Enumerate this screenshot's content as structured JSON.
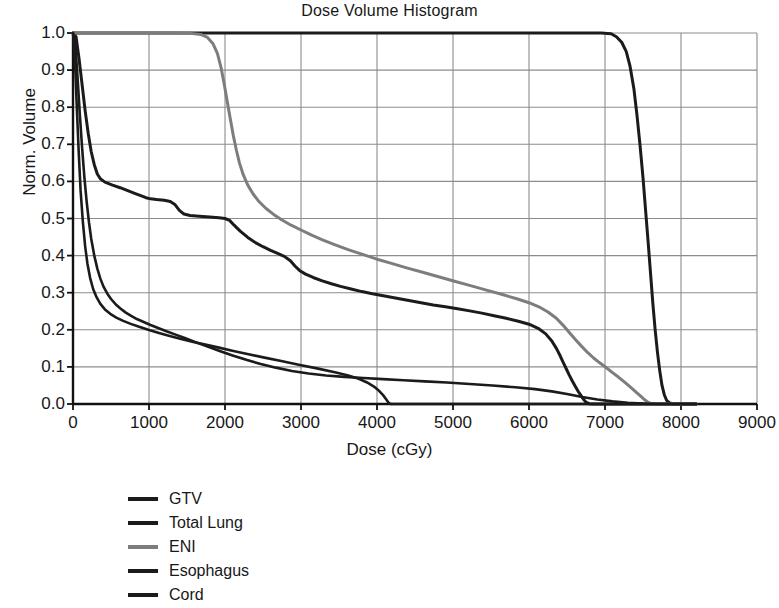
{
  "chart_data": {
    "type": "line",
    "title": "Dose Volume Histogram",
    "xlabel": "Dose (cGy)",
    "ylabel": "Norm. Volume",
    "xlim": [
      0,
      9000
    ],
    "ylim": [
      0,
      1.0
    ],
    "xticks": [
      0,
      1000,
      2000,
      3000,
      4000,
      5000,
      6000,
      7000,
      8000,
      9000
    ],
    "xtick_labels": [
      "0",
      "1000",
      "2000",
      "3000",
      "4000",
      "5000",
      "6000",
      "7000",
      "8000",
      "9000"
    ],
    "yticks": [
      0.0,
      0.1,
      0.2,
      0.3,
      0.4,
      0.5,
      0.6,
      0.7,
      0.8,
      0.9,
      1.0
    ],
    "ytick_labels": [
      "0.0",
      "0.1",
      "0.2",
      "0.3",
      "0.4",
      "0.5",
      "0.6",
      "0.7",
      "0.8",
      "0.9",
      "1.0"
    ],
    "grid": true,
    "legend_position": "below-left",
    "series": [
      {
        "name": "GTV",
        "color": "#1b1b1b",
        "width": 3.0,
        "points": [
          [
            0,
            1.0
          ],
          [
            500,
            1.0
          ],
          [
            1500,
            1.0
          ],
          [
            2500,
            1.0
          ],
          [
            3500,
            1.0
          ],
          [
            4500,
            1.0
          ],
          [
            5500,
            1.0
          ],
          [
            6200,
            1.0
          ],
          [
            6700,
            1.0
          ],
          [
            6950,
            1.0
          ],
          [
            7080,
            0.998
          ],
          [
            7150,
            0.99
          ],
          [
            7220,
            0.975
          ],
          [
            7280,
            0.95
          ],
          [
            7330,
            0.91
          ],
          [
            7380,
            0.85
          ],
          [
            7420,
            0.78
          ],
          [
            7460,
            0.7
          ],
          [
            7500,
            0.61
          ],
          [
            7535,
            0.52
          ],
          [
            7570,
            0.43
          ],
          [
            7600,
            0.35
          ],
          [
            7630,
            0.27
          ],
          [
            7660,
            0.2
          ],
          [
            7690,
            0.14
          ],
          [
            7720,
            0.09
          ],
          [
            7750,
            0.05
          ],
          [
            7780,
            0.025
          ],
          [
            7810,
            0.01
          ],
          [
            7850,
            0.003
          ],
          [
            7900,
            0.0
          ],
          [
            8200,
            0.0
          ]
        ]
      },
      {
        "name": "Total Lung",
        "color": "#1b1b1b",
        "width": 3.0,
        "points": [
          [
            0,
            1.0
          ],
          [
            40,
            0.99
          ],
          [
            80,
            0.93
          ],
          [
            120,
            0.86
          ],
          [
            160,
            0.79
          ],
          [
            200,
            0.73
          ],
          [
            240,
            0.68
          ],
          [
            280,
            0.645
          ],
          [
            320,
            0.62
          ],
          [
            360,
            0.607
          ],
          [
            420,
            0.598
          ],
          [
            520,
            0.59
          ],
          [
            620,
            0.583
          ],
          [
            720,
            0.575
          ],
          [
            820,
            0.567
          ],
          [
            900,
            0.561
          ],
          [
            960,
            0.556
          ],
          [
            1020,
            0.553
          ],
          [
            1100,
            0.551
          ],
          [
            1200,
            0.549
          ],
          [
            1280,
            0.546
          ],
          [
            1340,
            0.538
          ],
          [
            1400,
            0.522
          ],
          [
            1460,
            0.512
          ],
          [
            1540,
            0.508
          ],
          [
            1660,
            0.506
          ],
          [
            1800,
            0.504
          ],
          [
            1920,
            0.502
          ],
          [
            2000,
            0.5
          ],
          [
            2060,
            0.495
          ],
          [
            2120,
            0.482
          ],
          [
            2200,
            0.466
          ],
          [
            2300,
            0.449
          ],
          [
            2400,
            0.435
          ],
          [
            2500,
            0.424
          ],
          [
            2600,
            0.414
          ],
          [
            2700,
            0.405
          ],
          [
            2780,
            0.398
          ],
          [
            2860,
            0.386
          ],
          [
            2920,
            0.372
          ],
          [
            2980,
            0.36
          ],
          [
            3060,
            0.35
          ],
          [
            3160,
            0.341
          ],
          [
            3280,
            0.332
          ],
          [
            3400,
            0.324
          ],
          [
            3520,
            0.317
          ],
          [
            3660,
            0.31
          ],
          [
            3800,
            0.303
          ],
          [
            3940,
            0.297
          ],
          [
            4100,
            0.291
          ],
          [
            4260,
            0.285
          ],
          [
            4420,
            0.279
          ],
          [
            4580,
            0.273
          ],
          [
            4740,
            0.267
          ],
          [
            4900,
            0.262
          ],
          [
            5060,
            0.257
          ],
          [
            5220,
            0.251
          ],
          [
            5380,
            0.245
          ],
          [
            5540,
            0.238
          ],
          [
            5700,
            0.231
          ],
          [
            5860,
            0.223
          ],
          [
            6000,
            0.215
          ],
          [
            6120,
            0.204
          ],
          [
            6220,
            0.189
          ],
          [
            6300,
            0.17
          ],
          [
            6360,
            0.15
          ],
          [
            6410,
            0.13
          ],
          [
            6450,
            0.112
          ],
          [
            6490,
            0.095
          ],
          [
            6530,
            0.078
          ],
          [
            6570,
            0.062
          ],
          [
            6610,
            0.047
          ],
          [
            6650,
            0.033
          ],
          [
            6690,
            0.021
          ],
          [
            6720,
            0.012
          ],
          [
            6750,
            0.005
          ],
          [
            6790,
            0.001
          ],
          [
            6850,
            0.0
          ],
          [
            8200,
            0.0
          ]
        ]
      },
      {
        "name": "ENI",
        "color": "#7d7d7d",
        "width": 3.0,
        "points": [
          [
            0,
            1.0
          ],
          [
            400,
            1.0
          ],
          [
            900,
            1.0
          ],
          [
            1300,
            1.0
          ],
          [
            1550,
            0.999
          ],
          [
            1680,
            0.996
          ],
          [
            1770,
            0.988
          ],
          [
            1840,
            0.972
          ],
          [
            1900,
            0.945
          ],
          [
            1950,
            0.905
          ],
          [
            1990,
            0.862
          ],
          [
            2030,
            0.815
          ],
          [
            2070,
            0.768
          ],
          [
            2110,
            0.723
          ],
          [
            2150,
            0.684
          ],
          [
            2190,
            0.65
          ],
          [
            2240,
            0.618
          ],
          [
            2300,
            0.59
          ],
          [
            2370,
            0.566
          ],
          [
            2450,
            0.545
          ],
          [
            2540,
            0.527
          ],
          [
            2640,
            0.511
          ],
          [
            2750,
            0.496
          ],
          [
            2870,
            0.482
          ],
          [
            3000,
            0.469
          ],
          [
            3140,
            0.455
          ],
          [
            3290,
            0.442
          ],
          [
            3450,
            0.429
          ],
          [
            3620,
            0.416
          ],
          [
            3800,
            0.404
          ],
          [
            3990,
            0.391
          ],
          [
            4190,
            0.379
          ],
          [
            4390,
            0.367
          ],
          [
            4600,
            0.355
          ],
          [
            4810,
            0.343
          ],
          [
            5020,
            0.331
          ],
          [
            5230,
            0.319
          ],
          [
            5440,
            0.307
          ],
          [
            5650,
            0.295
          ],
          [
            5850,
            0.283
          ],
          [
            6000,
            0.273
          ],
          [
            6130,
            0.262
          ],
          [
            6250,
            0.248
          ],
          [
            6360,
            0.231
          ],
          [
            6450,
            0.212
          ],
          [
            6530,
            0.193
          ],
          [
            6610,
            0.174
          ],
          [
            6690,
            0.156
          ],
          [
            6770,
            0.139
          ],
          [
            6850,
            0.124
          ],
          [
            6930,
            0.111
          ],
          [
            7010,
            0.099
          ],
          [
            7090,
            0.086
          ],
          [
            7180,
            0.072
          ],
          [
            7270,
            0.057
          ],
          [
            7350,
            0.043
          ],
          [
            7420,
            0.03
          ],
          [
            7480,
            0.019
          ],
          [
            7530,
            0.01
          ],
          [
            7570,
            0.004
          ],
          [
            7620,
            0.0
          ],
          [
            8200,
            0.0
          ]
        ]
      },
      {
        "name": "Esophagus",
        "color": "#1b1b1b",
        "width": 2.6,
        "points": [
          [
            0,
            1.0
          ],
          [
            30,
            0.97
          ],
          [
            60,
            0.88
          ],
          [
            90,
            0.78
          ],
          [
            120,
            0.69
          ],
          [
            150,
            0.61
          ],
          [
            180,
            0.545
          ],
          [
            210,
            0.49
          ],
          [
            240,
            0.445
          ],
          [
            280,
            0.4
          ],
          [
            320,
            0.365
          ],
          [
            360,
            0.338
          ],
          [
            400,
            0.317
          ],
          [
            450,
            0.298
          ],
          [
            500,
            0.283
          ],
          [
            560,
            0.269
          ],
          [
            620,
            0.258
          ],
          [
            690,
            0.247
          ],
          [
            760,
            0.238
          ],
          [
            840,
            0.229
          ],
          [
            930,
            0.221
          ],
          [
            1020,
            0.213
          ],
          [
            1120,
            0.205
          ],
          [
            1230,
            0.196
          ],
          [
            1350,
            0.187
          ],
          [
            1480,
            0.177
          ],
          [
            1620,
            0.166
          ],
          [
            1770,
            0.155
          ],
          [
            1930,
            0.143
          ],
          [
            2100,
            0.131
          ],
          [
            2280,
            0.119
          ],
          [
            2470,
            0.108
          ],
          [
            2670,
            0.098
          ],
          [
            2880,
            0.089
          ],
          [
            3100,
            0.082
          ],
          [
            3330,
            0.077
          ],
          [
            3570,
            0.073
          ],
          [
            3820,
            0.07
          ],
          [
            4080,
            0.067
          ],
          [
            4350,
            0.064
          ],
          [
            4630,
            0.061
          ],
          [
            4920,
            0.058
          ],
          [
            5220,
            0.054
          ],
          [
            5520,
            0.05
          ],
          [
            5820,
            0.045
          ],
          [
            6080,
            0.04
          ],
          [
            6300,
            0.034
          ],
          [
            6500,
            0.027
          ],
          [
            6700,
            0.019
          ],
          [
            6900,
            0.012
          ],
          [
            7100,
            0.007
          ],
          [
            7300,
            0.003
          ],
          [
            7500,
            0.001
          ],
          [
            7700,
            0.0
          ],
          [
            8200,
            0.0
          ]
        ]
      },
      {
        "name": "Cord",
        "color": "#1b1b1b",
        "width": 2.6,
        "points": [
          [
            0,
            1.0
          ],
          [
            25,
            0.93
          ],
          [
            50,
            0.8
          ],
          [
            75,
            0.68
          ],
          [
            100,
            0.575
          ],
          [
            130,
            0.49
          ],
          [
            160,
            0.425
          ],
          [
            190,
            0.378
          ],
          [
            225,
            0.34
          ],
          [
            265,
            0.31
          ],
          [
            310,
            0.288
          ],
          [
            360,
            0.27
          ],
          [
            420,
            0.255
          ],
          [
            490,
            0.243
          ],
          [
            570,
            0.233
          ],
          [
            660,
            0.224
          ],
          [
            760,
            0.216
          ],
          [
            870,
            0.208
          ],
          [
            990,
            0.2
          ],
          [
            1120,
            0.192
          ],
          [
            1260,
            0.184
          ],
          [
            1410,
            0.176
          ],
          [
            1570,
            0.168
          ],
          [
            1740,
            0.16
          ],
          [
            1920,
            0.152
          ],
          [
            2110,
            0.143
          ],
          [
            2310,
            0.134
          ],
          [
            2520,
            0.125
          ],
          [
            2740,
            0.116
          ],
          [
            2970,
            0.106
          ],
          [
            3210,
            0.096
          ],
          [
            3460,
            0.085
          ],
          [
            3620,
            0.077
          ],
          [
            3760,
            0.068
          ],
          [
            3870,
            0.058
          ],
          [
            3960,
            0.047
          ],
          [
            4030,
            0.035
          ],
          [
            4080,
            0.024
          ],
          [
            4120,
            0.013
          ],
          [
            4150,
            0.004
          ],
          [
            4180,
            0.0
          ],
          [
            8200,
            0.0
          ]
        ]
      }
    ]
  },
  "legend": {
    "items": [
      {
        "label": "GTV",
        "color": "#1b1b1b"
      },
      {
        "label": "Total Lung",
        "color": "#1b1b1b"
      },
      {
        "label": "ENI",
        "color": "#7d7d7d"
      },
      {
        "label": "Esophagus",
        "color": "#1b1b1b"
      },
      {
        "label": "Cord",
        "color": "#1b1b1b"
      }
    ]
  },
  "style": {
    "axis_color": "#111111",
    "grid_color": "#8c8c8c",
    "background": "#ffffff"
  }
}
